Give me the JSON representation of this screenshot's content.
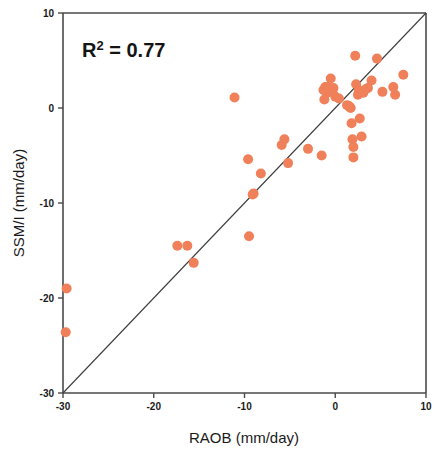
{
  "chart_data": {
    "type": "scatter",
    "title": "",
    "xlabel": "RAOB (mm/day)",
    "ylabel": "SSM/I (mm/day)",
    "xlim": [
      -30,
      10
    ],
    "ylim": [
      -30,
      10
    ],
    "xticks": [
      -30,
      -20,
      -10,
      0,
      10
    ],
    "yticks": [
      -30,
      -20,
      -10,
      0,
      10
    ],
    "xticklabels": [
      "-30",
      "-20",
      "-10",
      "0",
      "10"
    ],
    "yticklabels": [
      "-30",
      "-20",
      "-10",
      "0",
      "10"
    ],
    "grid": false,
    "legend": null,
    "annotations": [
      {
        "name": "r-squared",
        "text": "R2 = 0.77",
        "base": "R",
        "sup": "2",
        "rest": " = 0.77",
        "x": -26.5,
        "y": 7.2
      }
    ],
    "reference_line": {
      "name": "one-to-one-line",
      "label": "1:1 identity line",
      "from": [
        -30,
        -30
      ],
      "to": [
        10,
        10
      ]
    },
    "marker": {
      "shape": "circle",
      "color": "#f0805a",
      "size": 7
    },
    "points": [
      [
        -29.6,
        -19.0
      ],
      [
        -29.7,
        -23.6
      ],
      [
        -17.4,
        -14.5
      ],
      [
        -16.3,
        -14.5
      ],
      [
        -15.6,
        -16.3
      ],
      [
        -11.1,
        1.1
      ],
      [
        -9.5,
        -13.5
      ],
      [
        -9.6,
        -5.4
      ],
      [
        -9.1,
        -9.1
      ],
      [
        -9.0,
        -9.0
      ],
      [
        -8.2,
        -6.9
      ],
      [
        -5.9,
        -3.9
      ],
      [
        -5.6,
        -3.3
      ],
      [
        -5.2,
        -5.8
      ],
      [
        -3.0,
        -4.3
      ],
      [
        -1.5,
        -5.0
      ],
      [
        -1.3,
        1.9
      ],
      [
        -1.2,
        0.9
      ],
      [
        -1.1,
        2.2
      ],
      [
        -0.9,
        1.6
      ],
      [
        -0.8,
        2.2
      ],
      [
        -0.7,
        1.8
      ],
      [
        -0.6,
        2.0
      ],
      [
        -0.5,
        3.1
      ],
      [
        -0.4,
        1.8
      ],
      [
        -0.3,
        1.9
      ],
      [
        -0.2,
        2.1
      ],
      [
        0.0,
        1.2
      ],
      [
        0.4,
        1.0
      ],
      [
        1.3,
        0.3
      ],
      [
        1.5,
        0.2
      ],
      [
        1.6,
        0.1
      ],
      [
        1.7,
        0.0
      ],
      [
        1.8,
        -1.6
      ],
      [
        1.9,
        -3.3
      ],
      [
        2.0,
        -4.1
      ],
      [
        2.0,
        -5.2
      ],
      [
        2.2,
        5.5
      ],
      [
        2.3,
        2.5
      ],
      [
        2.5,
        1.4
      ],
      [
        2.6,
        1.9
      ],
      [
        2.7,
        -1.1
      ],
      [
        2.9,
        -3.0
      ],
      [
        3.1,
        1.6
      ],
      [
        3.4,
        2.0
      ],
      [
        3.6,
        2.1
      ],
      [
        4.0,
        2.9
      ],
      [
        4.6,
        5.2
      ],
      [
        5.2,
        1.7
      ],
      [
        6.4,
        2.2
      ],
      [
        6.6,
        1.4
      ],
      [
        7.5,
        3.5
      ]
    ]
  },
  "figure": {
    "background_color": "#ffffff",
    "axis_color": "#4a4a4a",
    "text_color": "#1a1a1a",
    "marker_color": "#f0805a",
    "line_color": "#3d3d3d"
  }
}
